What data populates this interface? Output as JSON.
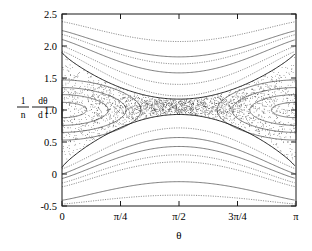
{
  "figure": {
    "type": "phase-portrait",
    "background": "#ffffff",
    "foreground": "#000000"
  },
  "axes": {
    "x": {
      "label": "θ",
      "ticks": [
        {
          "value": 0,
          "label": "0"
        },
        {
          "value": 0.7853981634,
          "label": "π/4"
        },
        {
          "value": 1.5707963268,
          "label": "π/2"
        },
        {
          "value": 2.3561944902,
          "label": "3π/4"
        },
        {
          "value": 3.1415926536,
          "label": "π"
        }
      ],
      "range": [
        0,
        3.1415926536
      ]
    },
    "y": {
      "label_numerator_1": "1",
      "label_denominator_1": "n",
      "label_numerator_2": "dθ",
      "label_denominator_2": "d t",
      "ticks": [
        {
          "value": -0.5,
          "label": "-0.5"
        },
        {
          "value": 0.0,
          "label": "0"
        },
        {
          "value": 0.5,
          "label": "0.5"
        },
        {
          "value": 1.0,
          "label": "1.0"
        },
        {
          "value": 1.5,
          "label": "1.5"
        },
        {
          "value": 2.0,
          "label": "2.0"
        },
        {
          "value": 2.5,
          "label": "2.5"
        }
      ],
      "range": [
        -0.5,
        2.5
      ]
    }
  },
  "chart_data": {
    "type": "scatter",
    "title": "",
    "xlabel": "θ",
    "ylabel": "(1/n) dθ/dt",
    "xlim": [
      0,
      3.1415926536
    ],
    "ylim": [
      -0.5,
      2.5
    ],
    "grid": false,
    "legend": "none",
    "xtick_values": [
      0,
      0.7853981634,
      1.5707963268,
      2.3561944902,
      3.1415926536
    ],
    "xtick_labels": [
      "0",
      "π/4",
      "π/2",
      "3π/4",
      "π"
    ],
    "ytick_values": [
      -0.5,
      0,
      0.5,
      1.0,
      1.5,
      2.0,
      2.5
    ],
    "ytick_labels": [
      "-0.5",
      "0",
      "0.5",
      "1.0",
      "1.5",
      "2.0",
      "2.5"
    ],
    "fixed_points": [
      {
        "kind": "elliptic",
        "x": 0.0,
        "y": 1.0,
        "label": "O-point"
      },
      {
        "kind": "elliptic",
        "x": 3.1415926536,
        "y": 1.0,
        "label": "O-point"
      },
      {
        "kind": "hyperbolic",
        "x": 1.5707963268,
        "y": 0.93,
        "label": "X-point"
      }
    ],
    "series": [
      {
        "name": "island-1-left",
        "kind": "libration",
        "center_x": 0.0,
        "center_y": 1.0,
        "amp_y": 0.12,
        "half_width_x": 0.33,
        "style": "solid"
      },
      {
        "name": "island-2-left",
        "kind": "libration",
        "center_x": 0.0,
        "center_y": 1.0,
        "amp_y": 0.24,
        "half_width_x": 0.62,
        "style": "solid"
      },
      {
        "name": "island-3-left",
        "kind": "libration",
        "center_x": 0.0,
        "center_y": 1.0,
        "amp_y": 0.35,
        "half_width_x": 0.86,
        "style": "solid"
      },
      {
        "name": "island-4-left",
        "kind": "libration",
        "center_x": 0.0,
        "center_y": 1.0,
        "amp_y": 0.47,
        "half_width_x": 1.06,
        "style": "solid"
      },
      {
        "name": "island-1-right",
        "kind": "libration",
        "center_x": 3.1415926536,
        "center_y": 1.0,
        "amp_y": 0.12,
        "half_width_x": 0.33,
        "style": "solid"
      },
      {
        "name": "island-2-right",
        "kind": "libration",
        "center_x": 3.1415926536,
        "center_y": 1.0,
        "amp_y": 0.24,
        "half_width_x": 0.62,
        "style": "solid"
      },
      {
        "name": "island-3-right",
        "kind": "libration",
        "center_x": 3.1415926536,
        "center_y": 1.0,
        "amp_y": 0.35,
        "half_width_x": 0.86,
        "style": "solid"
      },
      {
        "name": "island-4-right",
        "kind": "libration",
        "center_x": 3.1415926536,
        "center_y": 1.0,
        "amp_y": 0.47,
        "half_width_x": 1.06,
        "style": "solid"
      },
      {
        "name": "separatrix-lower",
        "kind": "separatrix",
        "edge_y": 0.1,
        "apex_y": 0.93,
        "style": "solid-heavy"
      },
      {
        "name": "separatrix-upper",
        "kind": "separatrix",
        "edge_y": 1.9,
        "apex_y": 1.17,
        "style": "solid-heavy"
      },
      {
        "name": "circulation-up-1",
        "kind": "circulation-above",
        "edge_y": 1.92,
        "apex_y": 1.22,
        "style": "dotted"
      },
      {
        "name": "circulation-up-2",
        "kind": "circulation-above",
        "edge_y": 2.0,
        "apex_y": 1.4,
        "style": "dashdot"
      },
      {
        "name": "circulation-up-3",
        "kind": "circulation-above",
        "edge_y": 2.1,
        "apex_y": 1.58,
        "style": "solid"
      },
      {
        "name": "circulation-up-4",
        "kind": "circulation-above",
        "edge_y": 2.18,
        "apex_y": 1.72,
        "style": "dotted"
      },
      {
        "name": "circulation-up-5",
        "kind": "circulation-above",
        "edge_y": 2.24,
        "apex_y": 1.83,
        "style": "solid"
      },
      {
        "name": "circulation-up-6",
        "kind": "circulation-above",
        "edge_y": 2.38,
        "apex_y": 2.07,
        "style": "dotted"
      },
      {
        "name": "circulation-dn-1",
        "kind": "circulation-below",
        "edge_y": 0.08,
        "apex_y": 0.72,
        "style": "dashdot"
      },
      {
        "name": "circulation-dn-2",
        "kind": "circulation-below",
        "edge_y": 0.0,
        "apex_y": 0.57,
        "style": "solid"
      },
      {
        "name": "circulation-dn-3",
        "kind": "circulation-below",
        "edge_y": -0.07,
        "apex_y": 0.43,
        "style": "solid"
      },
      {
        "name": "circulation-dn-4",
        "kind": "circulation-below",
        "edge_y": -0.14,
        "apex_y": 0.3,
        "style": "dotted"
      },
      {
        "name": "circulation-dn-5",
        "kind": "circulation-below",
        "edge_y": -0.2,
        "apex_y": 0.19,
        "style": "dashed"
      },
      {
        "name": "circulation-dn-6",
        "kind": "circulation-below",
        "edge_y": -0.41,
        "apex_y": -0.12,
        "style": "solid"
      },
      {
        "name": "circulation-dn-7",
        "kind": "circulation-below",
        "edge_y": -0.47,
        "apex_y": -0.33,
        "style": "dotted"
      },
      {
        "name": "stochastic-sea",
        "kind": "chaotic-scatter",
        "n_points": 2600,
        "inner_bound": "separatrix-lower",
        "outer_bound": "separatrix-upper",
        "style": "points"
      }
    ]
  }
}
